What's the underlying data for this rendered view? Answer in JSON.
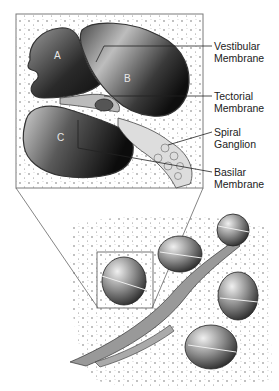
{
  "diagram": {
    "chambers": [
      {
        "id": "A",
        "label": "A"
      },
      {
        "id": "B",
        "label": "B"
      },
      {
        "id": "C",
        "label": "C"
      }
    ],
    "callouts": [
      {
        "line1": "Vestibular",
        "line2": "Membrane"
      },
      {
        "line1": "Tectorial",
        "line2": "Membrane"
      },
      {
        "line1": "Spiral",
        "line2": "Ganglion"
      },
      {
        "line1": "Basilar",
        "line2": "Membrane"
      }
    ],
    "colors": {
      "frame": "#7a7a7a",
      "ink": "#222222",
      "chamber_dark": "#1a1a1a",
      "chamber_light": "#d9d9d9",
      "background": "#ffffff"
    }
  }
}
